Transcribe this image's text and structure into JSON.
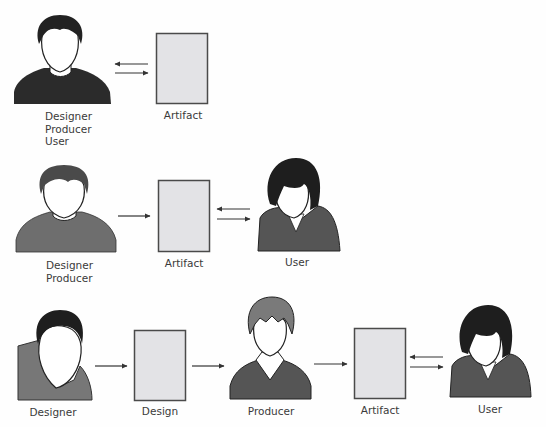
{
  "diagram": {
    "rows": [
      {
        "id": "row-1",
        "nodes": [
          {
            "type": "person",
            "label_lines": [
              "Designer",
              "Producer",
              "User"
            ]
          },
          {
            "type": "document",
            "label": "Artifact"
          }
        ],
        "edges": [
          {
            "from": "person",
            "to": "Artifact",
            "kind": "bidirectional"
          }
        ]
      },
      {
        "id": "row-2",
        "nodes": [
          {
            "type": "person",
            "label_lines": [
              "Designer",
              "Producer"
            ]
          },
          {
            "type": "document",
            "label": "Artifact"
          },
          {
            "type": "person",
            "label": "User"
          }
        ],
        "edges": [
          {
            "from": "Designer Producer",
            "to": "Artifact",
            "kind": "forward"
          },
          {
            "from": "Artifact",
            "to": "User",
            "kind": "bidirectional"
          }
        ]
      },
      {
        "id": "row-3",
        "nodes": [
          {
            "type": "person",
            "label": "Designer"
          },
          {
            "type": "document",
            "label": "Design"
          },
          {
            "type": "person",
            "label": "Producer"
          },
          {
            "type": "document",
            "label": "Artifact"
          },
          {
            "type": "person",
            "label": "User"
          }
        ],
        "edges": [
          {
            "from": "Designer",
            "to": "Design",
            "kind": "forward"
          },
          {
            "from": "Design",
            "to": "Producer",
            "kind": "forward"
          },
          {
            "from": "Producer",
            "to": "Artifact",
            "kind": "forward"
          },
          {
            "from": "Artifact",
            "to": "User",
            "kind": "bidirectional"
          }
        ]
      }
    ]
  },
  "labels": {
    "r1_person_l1": "Designer",
    "r1_person_l2": "Producer",
    "r1_person_l3": "User",
    "r1_doc": "Artifact",
    "r2_person_l1": "Designer",
    "r2_person_l2": "Producer",
    "r2_doc": "Artifact",
    "r2_user": "User",
    "r3_designer": "Designer",
    "r3_design": "Design",
    "r3_producer": "Producer",
    "r3_doc": "Artifact",
    "r3_user": "User"
  },
  "colors": {
    "document_fill": "#e3e3e6",
    "document_stroke": "#4a4a4a",
    "dark_fill": "#2b2b2b",
    "mid_fill": "#6e6e6e",
    "light_fill": "#8a8a8a",
    "arrow": "#333333",
    "text": "#3a3a3a"
  }
}
